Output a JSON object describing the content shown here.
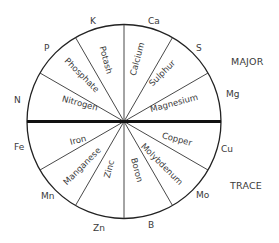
{
  "diagram": {
    "title": "",
    "groups": [
      {
        "name": "MAJOR",
        "label": "MAJOR",
        "position": "upper-half"
      },
      {
        "name": "TRACE",
        "label": "TRACE",
        "position": "lower-half"
      }
    ],
    "major_nutrients": [
      {
        "name": "Nitrogen",
        "symbol": "N"
      },
      {
        "name": "Phosphate",
        "symbol": "P"
      },
      {
        "name": "Potash",
        "symbol": "K"
      },
      {
        "name": "Calcium",
        "symbol": "Ca"
      },
      {
        "name": "Sulphur",
        "symbol": "S"
      },
      {
        "name": "Magnesium",
        "symbol": "Mg"
      }
    ],
    "trace_nutrients": [
      {
        "name": "Iron",
        "symbol": "Fe"
      },
      {
        "name": "Manganese",
        "symbol": "Mn"
      },
      {
        "name": "Zinc",
        "symbol": "Zn"
      },
      {
        "name": "Boron",
        "symbol": "B"
      },
      {
        "name": "Molybdenum",
        "symbol": "Mo"
      },
      {
        "name": "Copper",
        "symbol": "Cu"
      }
    ],
    "colors": {
      "line": "#222222",
      "text": "#3a3a3a",
      "background": "#ffffff"
    }
  }
}
